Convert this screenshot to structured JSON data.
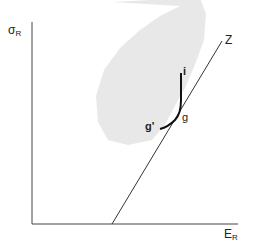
{
  "diagram": {
    "type": "risk-return efficient frontier",
    "axes": {
      "y_label_main": "σ",
      "y_label_sub": "R",
      "x_label_main": "E",
      "x_label_sub": "R"
    },
    "line_label": "Z",
    "curve_points": {
      "top": "i",
      "tangent": "g",
      "end": "g'"
    },
    "colors": {
      "axis": "#333333",
      "line": "#333333",
      "curve": "#111111",
      "shaded_region": "#e6e6e6"
    }
  }
}
